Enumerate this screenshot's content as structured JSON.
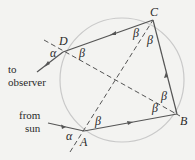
{
  "diagram": {
    "colors": {
      "background": "#f3f3f1",
      "circle": "#c9c9c9",
      "ray": "#555555",
      "dashed": "#555555",
      "text": "#2a2a2a"
    },
    "vertices": {
      "A": {
        "label": "A",
        "x": 84,
        "y": 131
      },
      "B": {
        "label": "B",
        "x": 177,
        "y": 114
      },
      "C": {
        "label": "C",
        "x": 153,
        "y": 20
      },
      "D": {
        "label": "D",
        "x": 63,
        "y": 52
      }
    },
    "angles": {
      "alpha": "α",
      "beta": "β"
    },
    "annotations": {
      "incoming_line1": "from",
      "incoming_line2": "sun",
      "outgoing_line1": "to",
      "outgoing_line2": "observer"
    }
  }
}
